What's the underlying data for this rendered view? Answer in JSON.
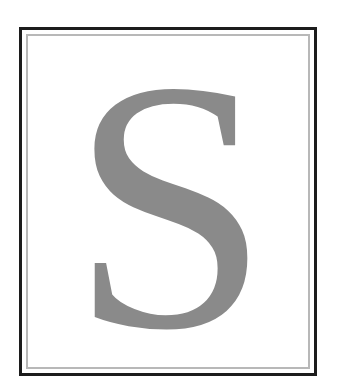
{
  "illustration": {
    "type": "decorative-initial",
    "letter": "S",
    "colors": {
      "background": "#ffffff",
      "outer_border": "#1c1c1c",
      "inner_border": "#b8b8b8",
      "letter": "#8a8a8a"
    }
  }
}
